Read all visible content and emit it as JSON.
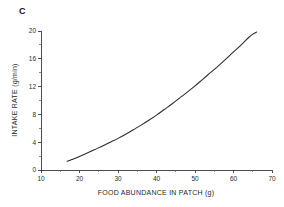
{
  "figure": {
    "panel_label": "C"
  },
  "chart_data": {
    "type": "line",
    "title": "",
    "subtitle": "",
    "xlabel": "FOOD ABUNDANCE IN PATCH (g)",
    "ylabel": "INTAKE RATE (g/min)",
    "xlim": [
      10,
      70
    ],
    "ylim": [
      0,
      20
    ],
    "xticks": [
      10,
      20,
      30,
      40,
      50,
      60,
      70
    ],
    "yticks": [
      0,
      4,
      8,
      12,
      16,
      20
    ],
    "xtick_labels": [
      "10",
      "20",
      "30",
      "40",
      "50",
      "60",
      "70"
    ],
    "ytick_labels": [
      "0",
      "4",
      "8",
      "12",
      "16",
      "20"
    ],
    "x_minor_ticks": [
      15,
      25,
      35,
      45,
      55,
      65
    ],
    "y_minor_ticks": [
      2,
      6,
      10,
      14,
      18
    ],
    "grid": false,
    "legend": null,
    "legend_position": "none",
    "annotations": [],
    "series": [
      {
        "name": "intake rate",
        "x": [
          16.8,
          18,
          20,
          22,
          24,
          26,
          28,
          30,
          32,
          34,
          36,
          38,
          40,
          42,
          44,
          46,
          48,
          50,
          52,
          54,
          56,
          58,
          60,
          62,
          64,
          65,
          66
        ],
        "y": [
          1.25,
          1.5,
          1.95,
          2.45,
          2.95,
          3.45,
          4.0,
          4.55,
          5.15,
          5.8,
          6.45,
          7.15,
          7.9,
          8.7,
          9.5,
          10.35,
          11.2,
          12.1,
          13.05,
          14.0,
          14.95,
          15.95,
          17.0,
          18.0,
          19.1,
          19.55,
          19.85
        ]
      }
    ]
  },
  "bottom_bleed": {
    "text": ""
  }
}
